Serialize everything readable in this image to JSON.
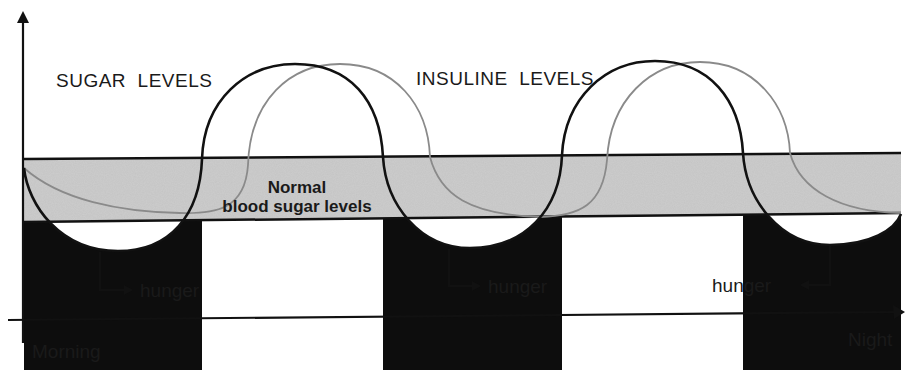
{
  "diagram": {
    "labels": {
      "sugar_levels": "SUGAR  LEVELS",
      "insuline_levels": "INSULINE  LEVELS",
      "normal_line1": "Normal",
      "normal_line2": "blood sugar levels",
      "hunger_1": "hunger",
      "hunger_2": "hunger",
      "hunger_3": "hunger",
      "x_start": "Morning",
      "x_end": "Night"
    },
    "series": [
      {
        "name": "sugar levels",
        "color": "#111111",
        "style": "thick black line"
      },
      {
        "name": "insuline levels",
        "color": "#8a8a8a",
        "style": "thin gray line"
      }
    ],
    "regions": [
      {
        "name": "normal blood sugar band",
        "color": "#c4c4c4"
      },
      {
        "name": "hunger zones (below normal)",
        "color": "#0d0d0d",
        "count": 3
      }
    ],
    "axes": {
      "x": {
        "from": "Morning",
        "to": "Night"
      },
      "y": {
        "label": ""
      }
    },
    "colors": {
      "band_fill": "#c4c4c4",
      "line_dark": "#111111",
      "line_gray": "#8a8a8a",
      "hunger_fill": "#0d0d0d",
      "background": "#ffffff"
    }
  }
}
